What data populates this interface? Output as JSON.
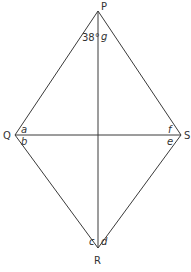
{
  "diagram": {
    "type": "rhombus-with-diagonals",
    "vertices": {
      "P": {
        "label": "P",
        "x": 98,
        "y": 11
      },
      "Q": {
        "label": "Q",
        "x": 15,
        "y": 135
      },
      "R": {
        "label": "R",
        "x": 98,
        "y": 248
      },
      "S": {
        "label": "S",
        "x": 181,
        "y": 135
      }
    },
    "angles": {
      "given": "38°",
      "g": "g",
      "a": "a",
      "b": "b",
      "c": "c",
      "d": "d",
      "e": "e",
      "f": "f"
    },
    "colors": {
      "line": "#3a3a3a",
      "text": "#333333",
      "background": "#ffffff"
    }
  }
}
